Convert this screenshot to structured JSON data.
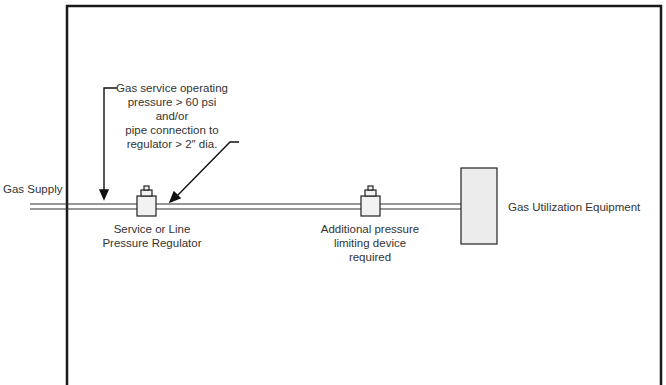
{
  "diagram": {
    "gas_supply_label": "Gas Supply",
    "annotation": {
      "line1": "Gas service operating",
      "line2": "pressure > 60 psi",
      "line3": "and/or",
      "line4": "pipe connection to",
      "line5": "regulator > 2″ dia."
    },
    "service_regulator": {
      "line1": "Service or Line",
      "line2": "Pressure Regulator"
    },
    "additional_device": {
      "line1": "Additional pressure",
      "line2": "limiting device",
      "line3": "required"
    },
    "equipment_label": "Gas Utilization Equipment",
    "colors": {
      "line": "#1a1a1a",
      "equipment_fill": "#ececec",
      "regulator_fill": "#f2f2f2"
    }
  }
}
